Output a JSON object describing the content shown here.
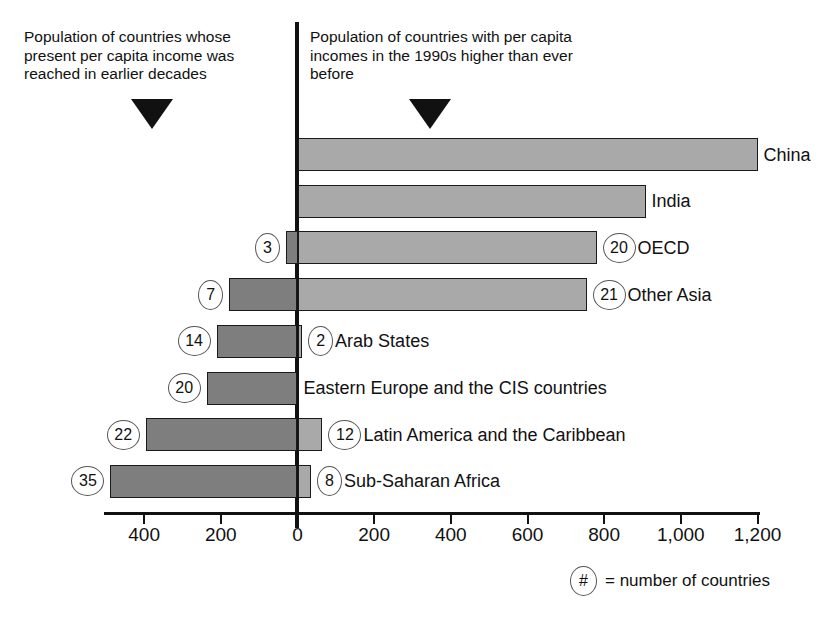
{
  "captions": {
    "left": "Population of countries whose present per capita income was reached in earlier decades",
    "right": "Population of countries with per capita incomes in the 1990s higher than ever before"
  },
  "footnote": {
    "symbol": "#",
    "text": "= number of countries"
  },
  "chart_data": {
    "type": "bar",
    "orientation": "horizontal",
    "title": "",
    "subtitle": "",
    "xlabel": "",
    "ylabel": "",
    "xlim": [
      -500,
      1200
    ],
    "grid": false,
    "legend_position": "none",
    "axis_ticks": [
      {
        "label": "400",
        "value": -400
      },
      {
        "label": "200",
        "value": -200
      },
      {
        "label": "0",
        "value": 0
      },
      {
        "label": "200",
        "value": 200
      },
      {
        "label": "400",
        "value": 400
      },
      {
        "label": "600",
        "value": 600
      },
      {
        "label": "800",
        "value": 800
      },
      {
        "label": "1,000",
        "value": 1000
      },
      {
        "label": "1,200",
        "value": 1200
      }
    ],
    "categories": [
      "China",
      "India",
      "OECD",
      "Other Asia",
      "Arab States",
      "Eastern Europe and the CIS countries",
      "Latin America and the Caribbean",
      "Sub-Saharan Africa"
    ],
    "series": [
      {
        "name": "Population of countries with per capita incomes in the 1990s higher than ever before",
        "color": "#a9a9a9",
        "values": [
          1200,
          908,
          780,
          754,
          12,
          0,
          65,
          35
        ]
      },
      {
        "name": "Population of countries whose present per capita income was reached in earlier decades",
        "color": "#7e7e7e",
        "values": [
          0,
          0,
          30,
          178,
          211,
          237,
          396,
          488
        ]
      }
    ],
    "counts_right": [
      null,
      null,
      "20",
      "21",
      "2",
      null,
      "12",
      "8"
    ],
    "counts_left": [
      null,
      null,
      "3",
      "7",
      "14",
      "20",
      "22",
      "35"
    ]
  }
}
